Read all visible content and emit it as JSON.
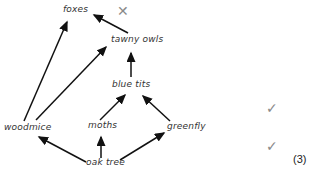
{
  "diagram": {
    "type": "food-web",
    "nodes": {
      "foxes": "foxes",
      "tawny_owls": "tawny owls",
      "blue_tits": "blue tits",
      "woodmice": "woodmice",
      "moths": "moths",
      "greenfly": "greenfly",
      "oak_tree": "oak tree"
    },
    "edges": [
      {
        "from": "tawny owls",
        "to": "foxes"
      },
      {
        "from": "woodmice",
        "to": "foxes"
      },
      {
        "from": "woodmice",
        "to": "tawny owls"
      },
      {
        "from": "blue tits",
        "to": "tawny owls"
      },
      {
        "from": "moths",
        "to": "blue tits"
      },
      {
        "from": "greenfly",
        "to": "blue tits"
      },
      {
        "from": "oak tree",
        "to": "woodmice"
      },
      {
        "from": "oak tree",
        "to": "moths"
      },
      {
        "from": "oak tree",
        "to": "greenfly"
      }
    ],
    "marks": {
      "cross": "✕",
      "tick_1": "✓",
      "tick_2": "✓"
    },
    "score": "(3)"
  }
}
